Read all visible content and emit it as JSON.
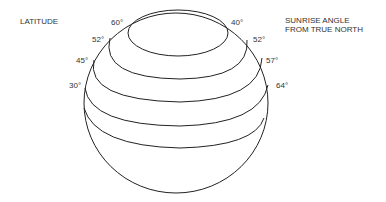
{
  "diagram": {
    "left_heading": "LATITUDE",
    "right_heading": "SUNRISE ANGLE\nFROM TRUE NORTH",
    "latitudes": [
      {
        "label": "60°",
        "angle": "40°"
      },
      {
        "label": "52°",
        "angle": "52°"
      },
      {
        "label": "45°",
        "angle": "57°"
      },
      {
        "label": "30°",
        "angle": "64°"
      }
    ],
    "line_color": "#222222"
  }
}
